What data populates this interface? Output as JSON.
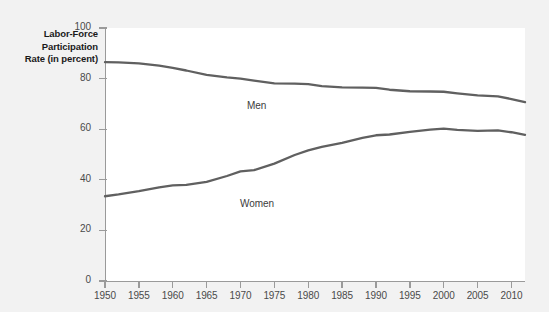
{
  "figure": {
    "background_color": "#f2f2f2",
    "plot_background_color": "#ffffff",
    "axis_color": "#9a9a9a",
    "line_color": "#606060"
  },
  "axes": {
    "y_title_lines": [
      "Labor-Force",
      "Participation",
      "Rate (in percent)"
    ],
    "y_ticks": [
      "0",
      "20",
      "40",
      "60",
      "80",
      "100"
    ],
    "x_ticks": [
      "1950",
      "1955",
      "1960",
      "1965",
      "1970",
      "1975",
      "1980",
      "1985",
      "1990",
      "1995",
      "2000",
      "2005",
      "2010"
    ]
  },
  "annotations": {
    "men_label": "Men",
    "women_label": "Women"
  },
  "chart_data": {
    "type": "line",
    "title": "",
    "subtitle": "",
    "xlabel": "",
    "ylabel": "Labor-Force Participation Rate (in percent)",
    "xlim": [
      1950,
      2012
    ],
    "ylim": [
      0,
      100
    ],
    "grid": false,
    "legend_position": "inline-annotation",
    "x": [
      1950,
      1952,
      1955,
      1958,
      1960,
      1962,
      1965,
      1968,
      1970,
      1972,
      1975,
      1978,
      1980,
      1982,
      1985,
      1988,
      1990,
      1992,
      1995,
      1998,
      2000,
      2002,
      2005,
      2008,
      2010,
      2012
    ],
    "series": [
      {
        "name": "Men",
        "color": "#606060",
        "values": [
          86.5,
          86.4,
          86.0,
          85.1,
          84.2,
          83.2,
          81.5,
          80.5,
          80.0,
          79.2,
          78.1,
          78.0,
          77.8,
          77.0,
          76.5,
          76.4,
          76.3,
          75.6,
          75.0,
          74.9,
          74.8,
          74.2,
          73.4,
          73.0,
          71.9,
          70.7
        ]
      },
      {
        "name": "Women",
        "color": "#606060",
        "values": [
          33.5,
          34.2,
          35.5,
          37.0,
          37.8,
          38.0,
          39.2,
          41.5,
          43.3,
          43.8,
          46.4,
          49.8,
          51.6,
          53.0,
          54.6,
          56.6,
          57.6,
          57.9,
          58.9,
          59.8,
          60.2,
          59.7,
          59.3,
          59.5,
          58.8,
          57.8
        ]
      }
    ]
  }
}
